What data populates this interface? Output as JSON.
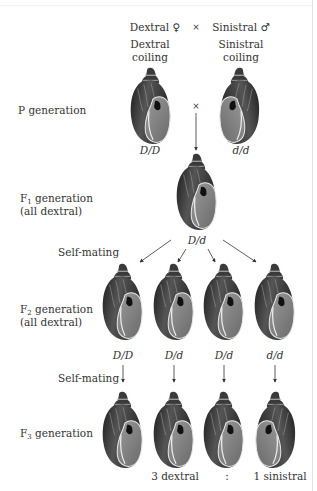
{
  "header": {
    "female_label": "Dextral ♀",
    "cross_symbol": "×",
    "male_label": "Sinistral ♂",
    "dextral_phenotype": [
      "Dextral",
      "coiling"
    ],
    "sinistral_phenotype": [
      "Sinistral",
      "coiling"
    ]
  },
  "rows": {
    "p": {
      "label": "P generation",
      "cross_symbol": "×",
      "genotypes": [
        "D/D",
        "d/d"
      ]
    },
    "f1": {
      "label_main": "F",
      "label_sub": "1",
      "label_rest": " generation",
      "label_line2": "(all dextral)",
      "genotype": "D/d"
    },
    "self1": {
      "label": "Self-mating"
    },
    "f2": {
      "label_main": "F",
      "label_sub": "2",
      "label_rest": " generation",
      "label_line2": "(all dextral)",
      "genotypes": [
        "D/D",
        "D/d",
        "D/d",
        "d/d"
      ]
    },
    "self2": {
      "label": "Self-mating"
    },
    "f3": {
      "label_main": "F",
      "label_sub": "3",
      "label_rest": " generation",
      "shells": [
        "dextral",
        "dextral",
        "dextral",
        "sinistral"
      ]
    }
  },
  "ratio": {
    "dextral": "3 dextral",
    "separator": ":",
    "sinistral": "1 sinistral"
  },
  "colors": {
    "shell_dark": "#2a2a2a",
    "shell_mid": "#6a6a6a",
    "shell_light": "#b5b5b5",
    "arrow": "#333333"
  }
}
